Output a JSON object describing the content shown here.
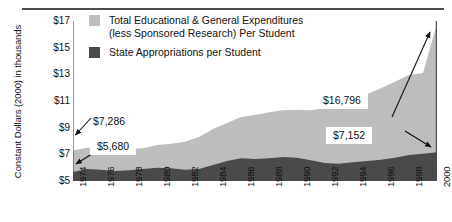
{
  "chart_data": {
    "type": "area",
    "title": "",
    "subtitle": "",
    "xlabel": "",
    "ylabel": "Constant Dollars (2000) in thousands",
    "xlim": [
      1974,
      2000
    ],
    "ylim": [
      5,
      17
    ],
    "yticks": [
      "$5",
      "$7",
      "$9",
      "$11",
      "$13",
      "$15",
      "$17"
    ],
    "ytick_values": [
      5,
      7,
      9,
      11,
      13,
      15,
      17
    ],
    "xticks": [
      "1974",
      "1976",
      "1978",
      "1980",
      "1982",
      "1984",
      "1986",
      "1988",
      "1990",
      "1992",
      "1994",
      "1996",
      "1998",
      "2000"
    ],
    "xtick_values": [
      1974,
      1976,
      1978,
      1980,
      1982,
      1984,
      1986,
      1988,
      1990,
      1992,
      1994,
      1996,
      1998,
      2000
    ],
    "minor_xticks_every": 1,
    "grid": false,
    "legend_position": "top-left-inside",
    "stacked": false,
    "x": [
      1974,
      1975,
      1976,
      1977,
      1978,
      1979,
      1980,
      1981,
      1982,
      1983,
      1984,
      1985,
      1986,
      1987,
      1988,
      1989,
      1990,
      1991,
      1992,
      1993,
      1994,
      1995,
      1996,
      1997,
      1998,
      1999,
      2000
    ],
    "series": [
      {
        "name": "Total Educational & General Expenditures (less Sponsored Research) Per Student",
        "color": "#bdbdbd",
        "units": "thousands of constant 2000 dollars",
        "values": [
          7.286,
          7.5,
          7.55,
          7.45,
          7.4,
          7.45,
          7.7,
          7.8,
          7.95,
          8.3,
          8.9,
          9.35,
          9.8,
          9.95,
          10.15,
          10.3,
          10.35,
          10.3,
          10.45,
          10.75,
          11.1,
          11.5,
          11.95,
          12.45,
          12.95,
          13.1,
          16.796
        ]
      },
      {
        "name": "State Appropriations per Student",
        "color": "#4a4a4a",
        "units": "thousands of constant 2000 dollars",
        "values": [
          5.68,
          5.9,
          5.85,
          5.75,
          5.8,
          5.9,
          6.0,
          5.95,
          5.85,
          5.9,
          6.2,
          6.5,
          6.7,
          6.65,
          6.7,
          6.8,
          6.75,
          6.55,
          6.35,
          6.3,
          6.4,
          6.5,
          6.6,
          6.75,
          6.95,
          7.05,
          7.152
        ]
      }
    ],
    "annotations": [
      {
        "id": "start-total",
        "label": "$7,286",
        "points_to_year": 1974,
        "points_to_series": "Total Educational & General Expenditures (less Sponsored Research) Per Student",
        "boxed": false
      },
      {
        "id": "start-state",
        "label": "$5,680",
        "points_to_year": 1974,
        "points_to_series": "State Appropriations per Student",
        "boxed": true
      },
      {
        "id": "end-total",
        "label": "$16,796",
        "points_to_year": 2000,
        "points_to_series": "Total Educational & General Expenditures (less Sponsored Research) Per Student",
        "boxed": true
      },
      {
        "id": "end-state",
        "label": "$7,152",
        "points_to_year": 2000,
        "points_to_series": "State Appropriations per Student",
        "boxed": true
      }
    ]
  },
  "legend": {
    "items": [
      {
        "label": "Total Educational & General Expenditures\n(less Sponsored Research) Per Student",
        "swatch": "light-gray-swatch"
      },
      {
        "label": "State Appropriations per Student",
        "swatch": "dark-gray-swatch"
      }
    ]
  },
  "colors": {
    "total_area": "#bdbdbd",
    "state_area": "#4a4a4a",
    "axis": "#4d4d4d",
    "text": "#111111",
    "background": "#ffffff"
  }
}
